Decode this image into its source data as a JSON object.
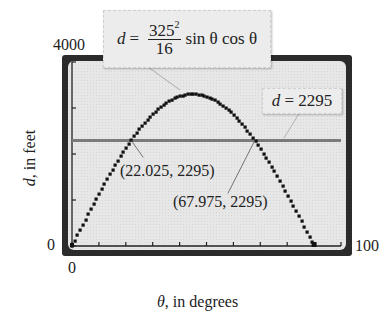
{
  "chart_data": {
    "type": "line",
    "title": "",
    "xlabel_var": "θ",
    "xlabel_rest": ", in degrees",
    "ylabel_var": "d",
    "ylabel_rest": ", in feet",
    "xlim": [
      0,
      100
    ],
    "ylim": [
      0,
      4000
    ],
    "x_tick_step": 10,
    "y_tick_step": 1000,
    "grid": false,
    "window_labels": {
      "ymax": "4000",
      "ymin": "0",
      "xmin": "0",
      "xmax": "100"
    },
    "series": [
      {
        "name": "d = 325^2/16 sin θ cos θ",
        "formula": {
          "lhs": "d",
          "eq": "=",
          "num_base": "325",
          "num_exp": "2",
          "den": "16",
          "rest": "sin θ cos θ"
        },
        "coefficient": 6601.5625,
        "x": [
          0,
          5,
          10,
          15,
          20,
          22.025,
          25,
          30,
          35,
          40,
          45,
          50,
          55,
          60,
          65,
          67.975,
          70,
          75,
          80,
          85,
          90
        ],
        "values": [
          0,
          573.2,
          1129.0,
          1650.4,
          2121.7,
          2295,
          2528.6,
          2858.6,
          3101.7,
          3250.6,
          3300.8,
          3250.6,
          3101.7,
          2858.6,
          2528.6,
          2295,
          2121.7,
          1650.4,
          1129.0,
          573.2,
          0
        ],
        "color": "#111111"
      },
      {
        "name": "d = 2295",
        "label": "d = 2295",
        "label_var": "d",
        "label_rest": " = 2295",
        "x": [
          0,
          100
        ],
        "values": [
          2295,
          2295
        ],
        "color": "#7a7a7a"
      }
    ],
    "annotations": [
      {
        "text": "(22.025, 2295)",
        "x": 22.025,
        "y": 2295
      },
      {
        "text": "(67.975, 2295)",
        "x": 67.975,
        "y": 2295
      }
    ]
  }
}
